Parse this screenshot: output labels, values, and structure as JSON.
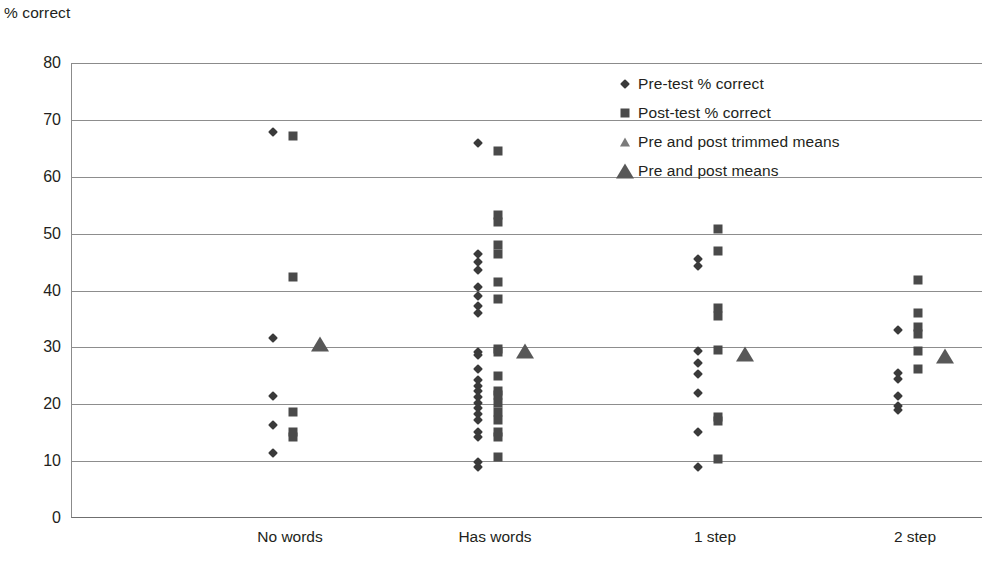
{
  "chart_data": {
    "type": "scatter",
    "title": "",
    "xlabel": "",
    "ylabel": "% correct",
    "ylim": [
      0,
      80
    ],
    "ytick_step": 10,
    "yticks": [
      "80",
      "70",
      "60",
      "50",
      "40",
      "30",
      "20",
      "10",
      "0"
    ],
    "grid": "horizontal",
    "legend_position": "top-right",
    "categories": [
      "No words",
      "Has words",
      "1 step",
      "2 step"
    ],
    "legend": [
      {
        "marker": "diamond-small",
        "label": "Pre-test % correct"
      },
      {
        "marker": "square-small",
        "label": "Post-test % correct"
      },
      {
        "marker": "triangle-small",
        "label": "Pre and post trimmed means"
      },
      {
        "marker": "triangle-large",
        "label": "Pre and post means"
      }
    ],
    "series": [
      {
        "name": "Pre-test % correct",
        "marker": "diamond-small",
        "points": [
          {
            "category": "No words",
            "value": 67.8
          },
          {
            "category": "No words",
            "value": 31.7
          },
          {
            "category": "No words",
            "value": 21.4
          },
          {
            "category": "No words",
            "value": 16.4
          },
          {
            "category": "No words",
            "value": 11.5
          },
          {
            "category": "Has words",
            "value": 66.0
          },
          {
            "category": "Has words",
            "value": 46.5
          },
          {
            "category": "Has words",
            "value": 45.0
          },
          {
            "category": "Has words",
            "value": 43.6
          },
          {
            "category": "Has words",
            "value": 40.6
          },
          {
            "category": "Has words",
            "value": 39.0
          },
          {
            "category": "Has words",
            "value": 37.3
          },
          {
            "category": "Has words",
            "value": 36.0
          },
          {
            "category": "Has words",
            "value": 29.2
          },
          {
            "category": "Has words",
            "value": 28.6
          },
          {
            "category": "Has words",
            "value": 26.2
          },
          {
            "category": "Has words",
            "value": 24.3
          },
          {
            "category": "Has words",
            "value": 23.2
          },
          {
            "category": "Has words",
            "value": 22.3
          },
          {
            "category": "Has words",
            "value": 21.2
          },
          {
            "category": "Has words",
            "value": 20.2
          },
          {
            "category": "Has words",
            "value": 19.3
          },
          {
            "category": "Has words",
            "value": 18.3
          },
          {
            "category": "Has words",
            "value": 17.3
          },
          {
            "category": "Has words",
            "value": 15.2
          },
          {
            "category": "Has words",
            "value": 14.2
          },
          {
            "category": "Has words",
            "value": 9.8
          },
          {
            "category": "Has words",
            "value": 9.0
          },
          {
            "category": "1 step",
            "value": 45.5
          },
          {
            "category": "1 step",
            "value": 44.3
          },
          {
            "category": "1 step",
            "value": 29.4
          },
          {
            "category": "1 step",
            "value": 27.2
          },
          {
            "category": "1 step",
            "value": 25.4
          },
          {
            "category": "1 step",
            "value": 22.0
          },
          {
            "category": "1 step",
            "value": 15.2
          },
          {
            "category": "1 step",
            "value": 9.0
          },
          {
            "category": "2 step",
            "value": 33.0
          },
          {
            "category": "2 step",
            "value": 25.5
          },
          {
            "category": "2 step",
            "value": 24.4
          },
          {
            "category": "2 step",
            "value": 21.5
          },
          {
            "category": "2 step",
            "value": 19.7
          },
          {
            "category": "2 step",
            "value": 19.0
          }
        ]
      },
      {
        "name": "Post-test % correct",
        "marker": "square-small",
        "points": [
          {
            "category": "No words",
            "value": 67.2
          },
          {
            "category": "No words",
            "value": 42.3
          },
          {
            "category": "No words",
            "value": 18.7
          },
          {
            "category": "No words",
            "value": 15.2
          },
          {
            "category": "No words",
            "value": 14.2
          },
          {
            "category": "Has words",
            "value": 64.6
          },
          {
            "category": "Has words",
            "value": 53.2
          },
          {
            "category": "Has words",
            "value": 52.0
          },
          {
            "category": "Has words",
            "value": 48.0
          },
          {
            "category": "Has words",
            "value": 46.4
          },
          {
            "category": "Has words",
            "value": 41.5
          },
          {
            "category": "Has words",
            "value": 38.5
          },
          {
            "category": "Has words",
            "value": 29.7
          },
          {
            "category": "Has words",
            "value": 29.2
          },
          {
            "category": "Has words",
            "value": 25.0
          },
          {
            "category": "Has words",
            "value": 22.4
          },
          {
            "category": "Has words",
            "value": 21.6
          },
          {
            "category": "Has words",
            "value": 20.2
          },
          {
            "category": "Has words",
            "value": 18.6
          },
          {
            "category": "Has words",
            "value": 17.2
          },
          {
            "category": "Has words",
            "value": 15.2
          },
          {
            "category": "Has words",
            "value": 14.3
          },
          {
            "category": "Has words",
            "value": 10.7
          },
          {
            "category": "1 step",
            "value": 50.8
          },
          {
            "category": "1 step",
            "value": 47.0
          },
          {
            "category": "1 step",
            "value": 37.0
          },
          {
            "category": "1 step",
            "value": 35.6
          },
          {
            "category": "1 step",
            "value": 29.6
          },
          {
            "category": "1 step",
            "value": 17.8
          },
          {
            "category": "1 step",
            "value": 17.0
          },
          {
            "category": "1 step",
            "value": 10.4
          },
          {
            "category": "2 step",
            "value": 41.8
          },
          {
            "category": "2 step",
            "value": 36.0
          },
          {
            "category": "2 step",
            "value": 33.5
          },
          {
            "category": "2 step",
            "value": 32.3
          },
          {
            "category": "2 step",
            "value": 29.3
          },
          {
            "category": "2 step",
            "value": 26.2
          }
        ]
      },
      {
        "name": "Pre and post trimmed means",
        "marker": "triangle-small",
        "points": []
      },
      {
        "name": "Pre and post means",
        "marker": "triangle-large",
        "points": [
          {
            "category": "No words",
            "value": 30.6
          },
          {
            "category": "Has words",
            "value": 29.4
          },
          {
            "category": "1 step",
            "value": 28.9
          },
          {
            "category": "2 step",
            "value": 28.5
          }
        ]
      }
    ]
  },
  "colors": {
    "diamond": "#3a3a3a",
    "square": "#4a4a4a",
    "triangle_small": "#7a7a7a",
    "triangle_large": "#585858",
    "gridline": "#8d8d8d",
    "axis": "#6f6f6f",
    "text": "#231f20"
  }
}
